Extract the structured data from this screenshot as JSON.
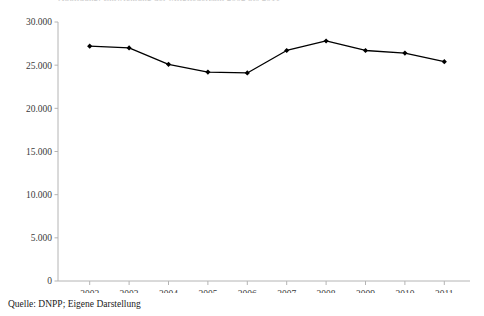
{
  "figure": {
    "title_clipped": "Abbildung: Entwicklung der Mitgliederzahl 2002 bis 2011",
    "caption": "Quelle: DNPP; Eigene Darstellung",
    "background_color": "#ffffff",
    "line_color": "#000000",
    "marker_color": "#000000",
    "axis_color": "#b4b4b4",
    "text_color": "#1a1a1a"
  },
  "chart_data": {
    "type": "line",
    "title": "",
    "xlabel": "",
    "ylabel": "",
    "categories": [
      "2002",
      "2003",
      "2004",
      "2005",
      "2006",
      "2007",
      "2008",
      "2009",
      "2010",
      "2011"
    ],
    "values": [
      27200,
      27000,
      25100,
      24200,
      24100,
      26700,
      27800,
      26700,
      26400,
      25400
    ],
    "series": [
      {
        "name": "Mitglieder",
        "values": [
          27200,
          27000,
          25100,
          24200,
          24100,
          26700,
          27800,
          26700,
          26400,
          25400
        ]
      }
    ],
    "ylim": [
      0,
      30000
    ],
    "xlim": [
      "2002",
      "2011"
    ],
    "ytick_values": [
      0,
      5000,
      10000,
      15000,
      20000,
      25000,
      30000
    ],
    "ytick_labels": [
      "0",
      "5.000",
      "10.000",
      "15.000",
      "20.000",
      "25.000",
      "30.000"
    ],
    "xtick_labels": [
      "2002",
      "2003",
      "2004",
      "2005",
      "2006",
      "2007",
      "2008",
      "2009",
      "2010",
      "2011"
    ],
    "grid": false,
    "legend": false,
    "legend_position": "none",
    "marker": "diamond",
    "number_format": "de-DE"
  }
}
